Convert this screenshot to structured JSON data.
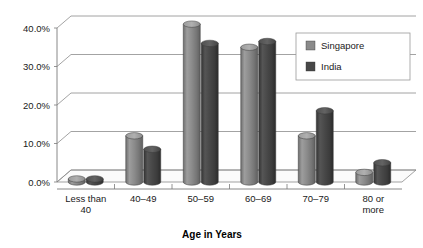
{
  "chart_data": {
    "type": "bar",
    "title": "",
    "subtitle": "",
    "xlabel": "Age in Years",
    "ylabel": "",
    "categories": [
      "Less than 40",
      "40–49",
      "50–59",
      "60–69",
      "70–79",
      "80 or more"
    ],
    "series": [
      {
        "name": "Singapore",
        "color": "#8a8a8a",
        "values": [
          0.8,
          12.0,
          41.0,
          35.0,
          12.0,
          2.5
        ]
      },
      {
        "name": "India",
        "color": "#474747",
        "values": [
          0.8,
          8.5,
          36.0,
          36.5,
          18.5,
          5.0
        ]
      }
    ],
    "ylim": [
      0,
      43
    ],
    "ytick_values": [
      0,
      10,
      20,
      30,
      40
    ],
    "ytick_labels": [
      "0.0%",
      "10.0%",
      "20.0%",
      "30.0%",
      "40.0%"
    ],
    "grid": true,
    "legend_position": "upper right",
    "style": "3d-cylinder"
  },
  "legend": {
    "entries": [
      {
        "label": "Singapore",
        "color": "#8a8a8a"
      },
      {
        "label": "India",
        "color": "#474747"
      }
    ]
  },
  "axes": {
    "x_title": "Age in Years",
    "x_labels": [
      {
        "line1": "Less than",
        "line2": "40"
      },
      {
        "line1": "40–49",
        "line2": ""
      },
      {
        "line1": "50–59",
        "line2": ""
      },
      {
        "line1": "60–69",
        "line2": ""
      },
      {
        "line1": "70–79",
        "line2": ""
      },
      {
        "line1": "80 or",
        "line2": "more"
      }
    ],
    "y_labels": [
      "40.0%",
      "30.0%",
      "20.0%",
      "10.0%",
      "0.0%"
    ]
  }
}
